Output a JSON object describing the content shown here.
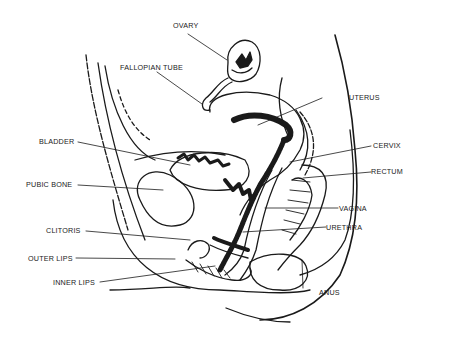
{
  "diagram": {
    "type": "anatomical-cross-section",
    "labels": {
      "ovary": "OVARY",
      "fallopian_tube": "FALLOPIAN TUBE",
      "uterus": "UTERUS",
      "bladder": "BLADDER",
      "cervix": "CERVIX",
      "pubic_bone": "PUBIC BONE",
      "rectum": "RECTUM",
      "vagina": "VAGINA",
      "clitoris": "CLITORIS",
      "urethra": "URETHRA",
      "outer_lips": "OUTER LIPS",
      "inner_lips": "INNER LIPS",
      "anus": "ANUS"
    },
    "colors": {
      "ink": "#1a1a1a",
      "background": "#ffffff"
    }
  }
}
